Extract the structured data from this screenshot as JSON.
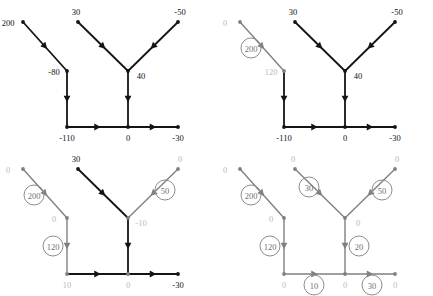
{
  "figure": {
    "type": "network-flow-diagram-sequence",
    "panel_count": 4,
    "colors": {
      "active_stroke": "#141414",
      "resolved_stroke": "#808080",
      "active_text": "#111111",
      "resolved_text": "#b9b9b9",
      "circle_stroke": "#8d8d8d",
      "circle_text": "#6f6f6f",
      "background": "#ffffff"
    },
    "geometry": {
      "node_positions": {
        "a_top_left": [
          23,
          22
        ],
        "b_mid_left": [
          67,
          71
        ],
        "c_bottom_left": [
          67,
          127
        ],
        "d_top_mid": [
          78,
          22
        ],
        "e_junction": [
          128,
          71
        ],
        "f_top_right": [
          178,
          22
        ],
        "g_bottom_mid": [
          128,
          127
        ],
        "h_bottom_right": [
          178,
          127
        ]
      },
      "edges": [
        {
          "from": "a_top_left",
          "to": "b_mid_left"
        },
        {
          "from": "b_mid_left",
          "to": "c_bottom_left"
        },
        {
          "from": "d_top_mid",
          "to": "e_junction"
        },
        {
          "from": "f_top_right",
          "to": "e_junction"
        },
        {
          "from": "e_junction",
          "to": "g_bottom_mid"
        },
        {
          "from": "c_bottom_left",
          "to": "g_bottom_mid"
        },
        {
          "from": "g_bottom_mid",
          "to": "h_bottom_right"
        }
      ]
    }
  },
  "panels": [
    {
      "id": "panel-1",
      "name": "initial-node-values",
      "node_labels": [
        {
          "key": "a_top_left",
          "text": "200",
          "state": "active"
        },
        {
          "key": "b_mid_left",
          "text": "-80",
          "state": "active"
        },
        {
          "key": "c_bottom_left",
          "text": "-110",
          "state": "active"
        },
        {
          "key": "d_top_mid",
          "text": "30",
          "state": "active"
        },
        {
          "key": "e_junction",
          "text": "40",
          "state": "active"
        },
        {
          "key": "f_top_right",
          "text": "-50",
          "state": "active"
        },
        {
          "key": "g_bottom_mid",
          "text": "0",
          "state": "active"
        },
        {
          "key": "h_bottom_right",
          "text": "-30",
          "state": "active"
        }
      ],
      "edge_states": [
        "active",
        "active",
        "active",
        "active",
        "active",
        "active",
        "active"
      ],
      "flow_labels": []
    },
    {
      "id": "panel-2",
      "name": "first-flow-assigned",
      "node_labels": [
        {
          "key": "a_top_left",
          "text": "0",
          "state": "resolved"
        },
        {
          "key": "b_mid_left",
          "text": "120",
          "state": "resolved"
        },
        {
          "key": "c_bottom_left",
          "text": "-110",
          "state": "active"
        },
        {
          "key": "d_top_mid",
          "text": "30",
          "state": "active"
        },
        {
          "key": "e_junction",
          "text": "40",
          "state": "active"
        },
        {
          "key": "f_top_right",
          "text": "-50",
          "state": "active"
        },
        {
          "key": "g_bottom_mid",
          "text": "0",
          "state": "active"
        },
        {
          "key": "h_bottom_right",
          "text": "-30",
          "state": "active"
        }
      ],
      "edge_states": [
        "resolved",
        "active",
        "active",
        "active",
        "active",
        "active",
        "active"
      ],
      "flow_labels": [
        {
          "edge": "a-b",
          "text": "200"
        }
      ]
    },
    {
      "id": "panel-3",
      "name": "three-flows-assigned",
      "node_labels": [
        {
          "key": "a_top_left",
          "text": "0",
          "state": "resolved"
        },
        {
          "key": "b_mid_left",
          "text": "0",
          "state": "resolved"
        },
        {
          "key": "c_bottom_left",
          "text": "10",
          "state": "resolved"
        },
        {
          "key": "d_top_mid",
          "text": "30",
          "state": "active"
        },
        {
          "key": "e_junction",
          "text": "-10",
          "state": "resolved"
        },
        {
          "key": "f_top_right",
          "text": "0",
          "state": "resolved"
        },
        {
          "key": "g_bottom_mid",
          "text": "0",
          "state": "resolved"
        },
        {
          "key": "h_bottom_right",
          "text": "-30",
          "state": "active"
        }
      ],
      "edge_states": [
        "resolved",
        "resolved",
        "active",
        "resolved",
        "active",
        "active",
        "active"
      ],
      "flow_labels": [
        {
          "edge": "a-b",
          "text": "200"
        },
        {
          "edge": "b-c",
          "text": "120"
        },
        {
          "edge": "f-e",
          "text": "50"
        }
      ]
    },
    {
      "id": "panel-4",
      "name": "all-flows-assigned",
      "node_labels": [
        {
          "key": "a_top_left",
          "text": "0",
          "state": "resolved"
        },
        {
          "key": "b_mid_left",
          "text": "0",
          "state": "resolved"
        },
        {
          "key": "c_bottom_left",
          "text": "0",
          "state": "resolved"
        },
        {
          "key": "d_top_mid",
          "text": "0",
          "state": "resolved"
        },
        {
          "key": "e_junction",
          "text": "0",
          "state": "resolved"
        },
        {
          "key": "f_top_right",
          "text": "0",
          "state": "resolved"
        },
        {
          "key": "g_bottom_mid",
          "text": "0",
          "state": "resolved"
        },
        {
          "key": "h_bottom_right",
          "text": "0",
          "state": "resolved"
        }
      ],
      "edge_states": [
        "resolved",
        "resolved",
        "resolved",
        "resolved",
        "resolved",
        "resolved",
        "resolved"
      ],
      "flow_labels": [
        {
          "edge": "a-b",
          "text": "200"
        },
        {
          "edge": "b-c",
          "text": "120"
        },
        {
          "edge": "d-e",
          "text": "30"
        },
        {
          "edge": "f-e",
          "text": "50"
        },
        {
          "edge": "e-g",
          "text": "20"
        },
        {
          "edge": "c-g",
          "text": "10"
        },
        {
          "edge": "g-h",
          "text": "30"
        }
      ]
    }
  ]
}
